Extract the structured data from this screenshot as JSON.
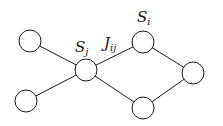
{
  "diagram": {
    "type": "graph",
    "colors": {
      "stroke": "#1a1a1a",
      "node_fill": "#ffffff",
      "background": "#ffffff"
    },
    "nodes": [
      {
        "id": "top-left",
        "x": 30,
        "y": 41,
        "r": 11
      },
      {
        "id": "bottom-left",
        "x": 26,
        "y": 101,
        "r": 11
      },
      {
        "id": "s-j",
        "x": 86,
        "y": 70,
        "r": 11,
        "label": "S",
        "sub": "j"
      },
      {
        "id": "s-i",
        "x": 143,
        "y": 42,
        "r": 11,
        "label": "S",
        "sub": "i"
      },
      {
        "id": "right",
        "x": 193,
        "y": 73,
        "r": 11
      },
      {
        "id": "bottom-right",
        "x": 143,
        "y": 108,
        "r": 11
      }
    ],
    "edges": [
      {
        "from": "top-left",
        "to": "s-j"
      },
      {
        "from": "bottom-left",
        "to": "s-j"
      },
      {
        "from": "s-j",
        "to": "s-i",
        "label": "J",
        "sub": "ij"
      },
      {
        "from": "s-j",
        "to": "bottom-right"
      },
      {
        "from": "s-i",
        "to": "right"
      },
      {
        "from": "bottom-right",
        "to": "right"
      }
    ],
    "labels": {
      "sj": {
        "main": "S",
        "sub": "j"
      },
      "si": {
        "main": "S",
        "sub": "i"
      },
      "jij": {
        "main": "J",
        "sub": "ij"
      }
    }
  }
}
